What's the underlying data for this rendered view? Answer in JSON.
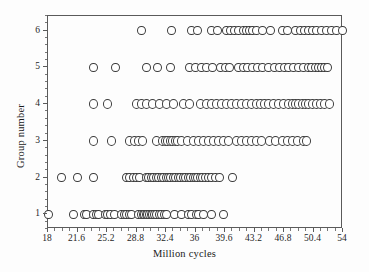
{
  "chart_data": {
    "type": "scatter",
    "title": "",
    "xlabel": "Million cycles",
    "ylabel": "Group number",
    "xlim": [
      18,
      54
    ],
    "ylim": [
      0.6,
      6.4
    ],
    "grid": false,
    "legend": "none",
    "xticks": [
      "18",
      "21.6",
      "25.2",
      "28.8",
      "32.4",
      "36",
      "39.6",
      "43.2",
      "46.8",
      "50.4",
      "54"
    ],
    "xtick_values": [
      18,
      21.6,
      25.2,
      28.8,
      32.4,
      36,
      39.6,
      43.2,
      46.8,
      50.4,
      54
    ],
    "xtick_step": 3.6,
    "yticks": [
      "1",
      "2",
      "3",
      "4",
      "5",
      "6"
    ],
    "ytick_values": [
      1,
      2,
      3,
      4,
      5,
      6
    ],
    "marker": "open-circle",
    "marker_edge_color": "#3c3c3c",
    "marker_face_color": "#ffffff",
    "marker_size_px": 9,
    "series": [
      {
        "name": "Group 1",
        "y": 1,
        "x": [
          18.0,
          21.1,
          22.4,
          22.7,
          23.6,
          23.9,
          24.2,
          25.0,
          25.3,
          25.6,
          26.1,
          27.0,
          27.3,
          27.6,
          27.9,
          28.2,
          29.1,
          29.4,
          29.6,
          29.8,
          30.0,
          30.2,
          30.4,
          30.6,
          30.8,
          31.0,
          31.3,
          31.6,
          31.9,
          32.2,
          32.5,
          33.4,
          34.3,
          35.2,
          35.5,
          36.1,
          36.4,
          37.0,
          37.9,
          39.4
        ]
      },
      {
        "name": "Group 2",
        "y": 2,
        "x": [
          19.6,
          21.6,
          23.5,
          27.6,
          28.0,
          28.4,
          28.8,
          29.2,
          30.0,
          30.3,
          30.6,
          30.9,
          31.2,
          31.5,
          31.8,
          32.1,
          32.4,
          32.7,
          33.0,
          33.3,
          33.6,
          33.9,
          34.2,
          34.5,
          34.8,
          35.1,
          35.4,
          35.7,
          36.0,
          36.3,
          36.6,
          36.9,
          37.2,
          37.6,
          38.0,
          38.4,
          38.9,
          40.5
        ]
      },
      {
        "name": "Group 3",
        "y": 3,
        "x": [
          23.5,
          25.7,
          28.0,
          28.5,
          29.0,
          29.5,
          31.2,
          32.0,
          32.3,
          32.6,
          32.9,
          33.2,
          33.5,
          33.8,
          34.3,
          35.0,
          35.8,
          36.4,
          37.0,
          37.6,
          38.2,
          38.8,
          39.4,
          40.0,
          41.0,
          41.6,
          42.2,
          42.8,
          43.4,
          44.0,
          45.0,
          45.8,
          46.6,
          47.2,
          47.8,
          48.4,
          49.2,
          49.6
        ]
      },
      {
        "name": "Group 4",
        "y": 4,
        "x": [
          23.5,
          25.3,
          28.8,
          29.4,
          30.0,
          30.8,
          31.6,
          32.5,
          33.3,
          34.5,
          35.3,
          36.6,
          37.4,
          38.0,
          38.6,
          39.2,
          39.8,
          40.4,
          41.0,
          41.6,
          42.2,
          42.8,
          43.4,
          43.9,
          44.4,
          44.9,
          45.5,
          46.1,
          46.7,
          47.3,
          47.8,
          48.2,
          48.6,
          49.0,
          49.4,
          49.8,
          50.3,
          50.8,
          51.3,
          51.8,
          52.4
        ]
      },
      {
        "name": "Group 5",
        "y": 5,
        "x": [
          23.5,
          26.2,
          30.0,
          31.4,
          33.0,
          35.3,
          36.0,
          36.7,
          37.4,
          38.1,
          39.0,
          39.6,
          40.2,
          41.2,
          41.8,
          42.4,
          43.0,
          43.6,
          44.2,
          44.9,
          45.6,
          46.2,
          46.8,
          47.4,
          48.0,
          48.6,
          49.2,
          49.8,
          50.2,
          50.6,
          51.0,
          51.4,
          51.8,
          52.1
        ]
      },
      {
        "name": "Group 6",
        "y": 6,
        "x": [
          29.4,
          33.1,
          35.5,
          36.2,
          38.0,
          38.7,
          39.8,
          40.3,
          40.8,
          41.3,
          41.8,
          42.2,
          42.6,
          43.0,
          43.4,
          44.2,
          45.2,
          46.6,
          47.2,
          48.2,
          48.8,
          49.3,
          49.8,
          50.3,
          50.8,
          51.4,
          52.0,
          52.6,
          53.2,
          53.9
        ]
      }
    ]
  }
}
